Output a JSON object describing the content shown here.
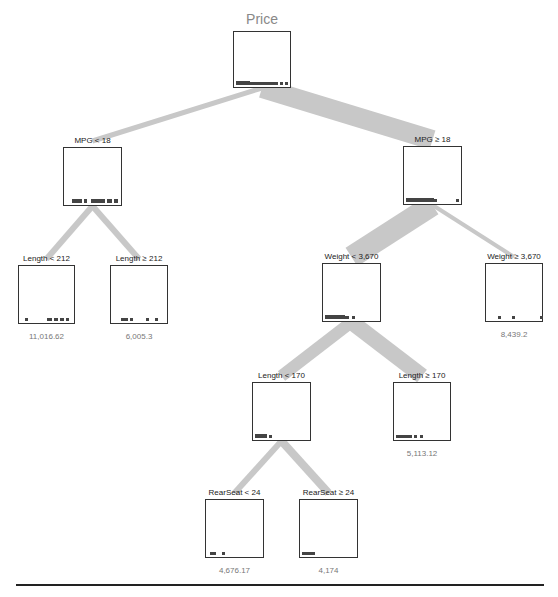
{
  "tree": {
    "title": "Price",
    "edge_color": "#c8c8c8",
    "box_border_color": "#333333",
    "nodes": [
      {
        "id": "root",
        "label": "Price",
        "box": [
          233,
          31,
          58,
          57
        ],
        "value": null,
        "ticks": [
          [
            0,
            14,
            4
          ],
          [
            14,
            24,
            3
          ],
          [
            38,
            4,
            3
          ],
          [
            44,
            3,
            3
          ],
          [
            49,
            3,
            3
          ]
        ]
      },
      {
        "id": "mpg_lt_18",
        "label": "MPG < 18",
        "box": [
          63,
          147,
          59,
          59
        ],
        "value": null,
        "ticks": [
          [
            6,
            10,
            4
          ],
          [
            18,
            3,
            4
          ],
          [
            25,
            14,
            4
          ],
          [
            41,
            5,
            4
          ],
          [
            48,
            4,
            4
          ]
        ]
      },
      {
        "id": "mpg_ge_18",
        "label": "MPG ≥ 18",
        "box": [
          403,
          146,
          59,
          59
        ],
        "value": null,
        "ticks": [
          [
            0,
            28,
            4
          ],
          [
            28,
            3,
            3
          ],
          [
            50,
            3,
            3
          ]
        ]
      },
      {
        "id": "length_lt_212",
        "label": "Length < 212",
        "box": [
          18,
          265,
          57,
          59
        ],
        "value": "11,016.62",
        "ticks": [
          [
            4,
            3,
            3
          ],
          [
            26,
            5,
            3
          ],
          [
            33,
            4,
            3
          ],
          [
            39,
            4,
            3
          ],
          [
            45,
            3,
            3
          ]
        ]
      },
      {
        "id": "length_ge_212",
        "label": "Length ≥ 212",
        "box": [
          110,
          265,
          58,
          59
        ],
        "value": "6,005.3",
        "ticks": [
          [
            8,
            7,
            3
          ],
          [
            17,
            3,
            3
          ],
          [
            33,
            3,
            3
          ],
          [
            42,
            3,
            3
          ]
        ]
      },
      {
        "id": "weight_lt_3670",
        "label": "Weight < 3,670",
        "box": [
          322,
          263,
          59,
          59
        ],
        "value": null,
        "ticks": [
          [
            0,
            20,
            4
          ],
          [
            20,
            4,
            3
          ],
          [
            27,
            3,
            3
          ]
        ]
      },
      {
        "id": "weight_ge_3670",
        "label": "Weight ≥ 3,670",
        "box": [
          485,
          263,
          58,
          59
        ],
        "value": "8,439.2",
        "ticks": [
          [
            10,
            3,
            3
          ],
          [
            24,
            3,
            3
          ],
          [
            52,
            3,
            3
          ]
        ]
      },
      {
        "id": "length_lt_170",
        "label": "Length < 170",
        "box": [
          252,
          382,
          59,
          59
        ],
        "value": null,
        "ticks": [
          [
            0,
            12,
            4
          ],
          [
            14,
            3,
            3
          ]
        ]
      },
      {
        "id": "length_ge_170",
        "label": "Length ≥ 170",
        "box": [
          393,
          382,
          58,
          59
        ],
        "value": "5,113.12",
        "ticks": [
          [
            0,
            16,
            3
          ],
          [
            18,
            3,
            3
          ],
          [
            24,
            3,
            3
          ]
        ]
      },
      {
        "id": "rearseat_lt_24",
        "label": "RearSeat < 24",
        "box": [
          205,
          499,
          59,
          59
        ],
        "value": "4,676.17",
        "ticks": [
          [
            2,
            6,
            3
          ],
          [
            14,
            3,
            3
          ]
        ]
      },
      {
        "id": "rearseat_ge_24",
        "label": "RearSeat ≥ 24",
        "box": [
          299,
          499,
          59,
          59
        ],
        "value": "4,174",
        "ticks": [
          [
            0,
            13,
            3
          ]
        ]
      }
    ],
    "edges": [
      {
        "from": "root",
        "to": "mpg_lt_18",
        "width": 5
      },
      {
        "from": "root",
        "to": "mpg_ge_18",
        "width": 20
      },
      {
        "from": "mpg_lt_18",
        "to": "length_lt_212",
        "width": 6
      },
      {
        "from": "mpg_lt_18",
        "to": "length_ge_212",
        "width": 6
      },
      {
        "from": "mpg_ge_18",
        "to": "weight_lt_3670",
        "width": 22
      },
      {
        "from": "mpg_ge_18",
        "to": "weight_ge_3670",
        "width": 4
      },
      {
        "from": "weight_lt_3670",
        "to": "length_lt_170",
        "width": 12
      },
      {
        "from": "weight_lt_3670",
        "to": "length_ge_170",
        "width": 16
      },
      {
        "from": "length_lt_170",
        "to": "rearseat_lt_24",
        "width": 6
      },
      {
        "from": "length_lt_170",
        "to": "rearseat_ge_24",
        "width": 8
      }
    ]
  },
  "labels": {
    "root_title": "Price",
    "mpg_lt_18": "MPG < 18",
    "mpg_ge_18": "MPG ≥ 18",
    "length_lt_212": "Length < 212",
    "length_ge_212": "Length ≥ 212",
    "weight_lt_3670": "Weight < 3,670",
    "weight_ge_3670": "Weight ≥ 3,670",
    "length_lt_170": "Length < 170",
    "length_ge_170": "Length ≥ 170",
    "rearseat_lt_24": "RearSeat < 24",
    "rearseat_ge_24": "RearSeat ≥ 24"
  },
  "values": {
    "length_lt_212": "11,016.62",
    "length_ge_212": "6,005.3",
    "weight_ge_3670": "8,439.2",
    "length_ge_170": "5,113.12",
    "rearseat_lt_24": "4,676.17",
    "rearseat_ge_24": "4,174"
  }
}
